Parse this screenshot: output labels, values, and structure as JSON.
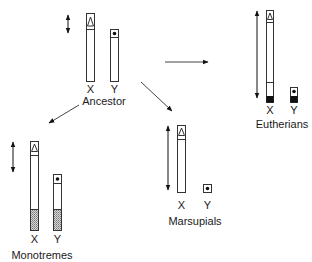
{
  "colors": {
    "line": "#333333",
    "black_block": "#111111",
    "hatch": "#888888",
    "background": "#ffffff"
  },
  "groups": {
    "ancestor": {
      "label": "Ancestor",
      "x_label": "X",
      "y_label": "Y"
    },
    "eutherians": {
      "label": "Eutherians",
      "x_label": "X",
      "y_label": "Y"
    },
    "monotremes": {
      "label": "Monotremes",
      "x_label": "X",
      "y_label": "Y"
    },
    "marsupials": {
      "label": "Marsupials",
      "x_label": "X",
      "y_label": "Y"
    }
  },
  "legend_symbols": {
    "x_marker": "triangle-icon",
    "y_marker": "dot-icon",
    "eutherian_added_region": "black-block",
    "monotreme_added_region": "hatched-block"
  }
}
